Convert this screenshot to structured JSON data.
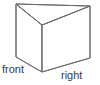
{
  "figure": {
    "kind": "triangular-prism-diagram",
    "background_color": "#ffffff",
    "stroke_color": "#6b6b6b",
    "face_fill_color": "#ffffff",
    "text_color": "#3a3a3a",
    "width": 100,
    "height": 85,
    "labels": {
      "front": "front",
      "right": "right"
    },
    "vertices": {
      "top_back_left": [
        16,
        4
      ],
      "top_back_right": [
        90,
        6
      ],
      "top_front": [
        42,
        25
      ],
      "bottom_left": [
        16,
        57
      ],
      "bottom_right": [
        90,
        58
      ],
      "bottom_front": [
        42,
        72
      ]
    },
    "faces": {
      "top_triangle": "16,4 90,6 42,25",
      "front_left_quad": "16,4 42,25 42,72 16,57",
      "front_right_quad": "42,25 90,6 90,58 42,72"
    },
    "edges": [
      "top_back_left-to-top_back_right",
      "top_back_right-to-top_front",
      "top_front-to-top_back_left",
      "top_back_left-to-bottom_left",
      "top_front-to-bottom_front",
      "top_back_right-to-bottom_right",
      "bottom_left-to-bottom_front",
      "bottom_front-to-bottom_right"
    ]
  }
}
